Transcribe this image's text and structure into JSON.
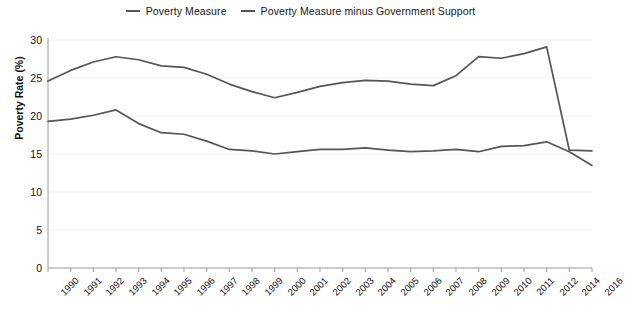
{
  "chart_data": {
    "type": "line",
    "title": "",
    "xlabel": "",
    "ylabel": "Poverty Rate (%)",
    "ylim": [
      0,
      30
    ],
    "yticks": [
      0,
      5,
      10,
      15,
      20,
      25,
      30
    ],
    "grid": true,
    "legend_position": "top-center",
    "categories": [
      "1990",
      "1991",
      "1992",
      "1993",
      "1994",
      "1995",
      "1996",
      "1997",
      "1998",
      "1999",
      "2000",
      "2001",
      "2002",
      "2003",
      "2004",
      "2005",
      "2006",
      "2007",
      "2008",
      "2009",
      "2010",
      "2011",
      "2012",
      "2014",
      "2016"
    ],
    "series": [
      {
        "name": "Poverty Measure minus Government Support",
        "color": "#555555",
        "values": [
          24.6,
          26.0,
          27.1,
          27.8,
          27.4,
          26.6,
          26.4,
          25.5,
          24.2,
          23.2,
          22.4,
          23.1,
          23.9,
          24.4,
          24.7,
          24.6,
          24.2,
          24.0,
          25.3,
          27.8,
          27.6,
          28.2,
          29.1,
          15.5,
          15.4
        ]
      },
      {
        "name": "Poverty Measure",
        "color": "#555555",
        "values": [
          19.3,
          19.6,
          20.1,
          20.8,
          19.0,
          17.8,
          17.6,
          16.7,
          15.6,
          15.4,
          15.0,
          15.3,
          15.6,
          15.6,
          15.8,
          15.5,
          15.3,
          15.4,
          15.6,
          15.3,
          16.0,
          16.1,
          16.6,
          15.3,
          13.5
        ]
      }
    ]
  },
  "legend": {
    "items": [
      {
        "label": "Poverty Measure",
        "marker": "line-swatch"
      },
      {
        "label": "Poverty Measure minus Government Support",
        "marker": "line-swatch"
      }
    ]
  },
  "axes": {
    "y_axis_title": "Poverty Rate (%)"
  }
}
